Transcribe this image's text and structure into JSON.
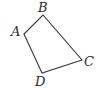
{
  "diagram": {
    "type": "quadrilateral",
    "stroke_color": "#3a3a3a",
    "background": "#ffffff",
    "vertices": [
      {
        "name": "A",
        "x": 24,
        "y": 34,
        "label_x": 11,
        "label_y": 36
      },
      {
        "name": "B",
        "x": 43,
        "y": 15,
        "label_x": 38,
        "label_y": 12
      },
      {
        "name": "C",
        "x": 82,
        "y": 60,
        "label_x": 84,
        "label_y": 66
      },
      {
        "name": "D",
        "x": 42,
        "y": 73,
        "label_x": 35,
        "label_y": 86
      }
    ],
    "edges": [
      [
        "A",
        "B"
      ],
      [
        "B",
        "C"
      ],
      [
        "C",
        "D"
      ],
      [
        "D",
        "A"
      ]
    ]
  }
}
